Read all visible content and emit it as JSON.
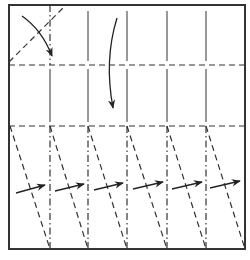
{
  "diagram": {
    "type": "origami-crease-pattern",
    "colors": {
      "background": "#ffffff",
      "line": "#333333",
      "arrow": "#222222"
    },
    "frame": {
      "x": 9,
      "y": 5,
      "width": 236,
      "height": 244
    },
    "columns_x": [
      9,
      50,
      88,
      127,
      167,
      206,
      245
    ],
    "rows_y": {
      "top": 5,
      "fold1": 65,
      "fold2": 126,
      "bottom": 249
    },
    "top_section": {
      "corner_valley_fold": {
        "x1": 9,
        "y1": 62,
        "x2": 66,
        "y2": 5
      },
      "mountain_vertical_x": [
        50
      ],
      "solid_vertical_x": [
        88,
        127,
        167,
        206
      ],
      "corner_arrow": {
        "from": [
          22,
          16
        ],
        "ctrl": [
          42,
          30
        ],
        "to": [
          52,
          56
        ]
      },
      "down_arrow": {
        "from": [
          117,
          18
        ],
        "ctrl": [
          104,
          60
        ],
        "to": [
          113,
          108
        ]
      }
    },
    "middle_section": {
      "solid_vertical_x": [
        50,
        88,
        127,
        167,
        206
      ]
    },
    "bottom_section": {
      "mountain_vertical_x": [
        50,
        88,
        127,
        167,
        206
      ],
      "diagonal_valley_folds": [
        {
          "x1": 10,
          "x2": 50
        },
        {
          "x1": 50,
          "x2": 88
        },
        {
          "x1": 88,
          "x2": 127
        },
        {
          "x1": 127,
          "x2": 167
        },
        {
          "x1": 167,
          "x2": 206
        },
        {
          "x1": 206,
          "x2": 245
        }
      ],
      "pleat_arrows": [
        {
          "from": [
            16,
            193
          ],
          "to": [
            45,
            185
          ]
        },
        {
          "from": [
            55,
            191
          ],
          "to": [
            84,
            184
          ]
        },
        {
          "from": [
            94,
            190
          ],
          "to": [
            123,
            183
          ]
        },
        {
          "from": [
            133,
            189
          ],
          "to": [
            163,
            182
          ]
        },
        {
          "from": [
            172,
            189
          ],
          "to": [
            202,
            182
          ]
        },
        {
          "from": [
            210,
            188
          ],
          "to": [
            240,
            181
          ]
        }
      ]
    }
  }
}
